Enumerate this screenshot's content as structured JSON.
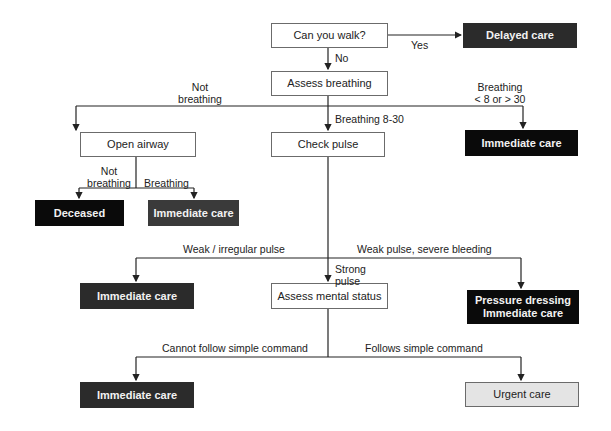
{
  "nodes": {
    "can_walk": "Can you walk?",
    "delayed_care": "Delayed care",
    "assess_breathing": "Assess breathing",
    "open_airway": "Open airway",
    "check_pulse": "Check pulse",
    "immediate_care_breathing_rate": "Immediate care",
    "deceased": "Deceased",
    "immediate_care_airway": "Immediate care",
    "immediate_care_weak_pulse": "Immediate care",
    "assess_mental_status": "Assess mental status",
    "pressure_dressing_line1": "Pressure dressing",
    "pressure_dressing_line2": "Immediate care",
    "immediate_care_mental": "Immediate care",
    "urgent_care": "Urgent care"
  },
  "edges": {
    "yes": "Yes",
    "no": "No",
    "not_breathing_1a": "Not",
    "not_breathing_1b": "breathing",
    "breathing_rate_a": "Breathing",
    "breathing_rate_b": "< 8 or > 30",
    "breathing_8_30": "Breathing 8-30",
    "not_breathing_2a": "Not",
    "not_breathing_2b": "breathing",
    "breathing": "Breathing",
    "weak_irregular": "Weak / irregular pulse",
    "weak_bleeding": "Weak pulse, severe bleeding",
    "strong_a": "Strong",
    "strong_b": "pulse",
    "cannot_follow": "Cannot follow simple command",
    "follows": "Follows simple command"
  },
  "colors": {
    "line": "#222222",
    "dark_box": "#2b2b2b",
    "black_box": "#0a0a0a",
    "light_box": "#e4e4e4"
  }
}
